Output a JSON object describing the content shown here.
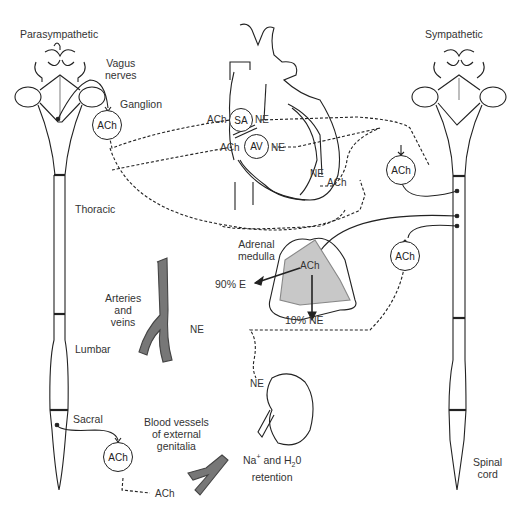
{
  "titles": {
    "left": "Parasympathetic",
    "right": "Sympathetic"
  },
  "labels": {
    "vagus_nerves_1": "Vagus",
    "vagus_nerves_2": "nerves",
    "ganglion": "Ganglion",
    "thoracic": "Thoracic",
    "lumbar": "Lumbar",
    "sacral": "Sacral",
    "arteries_1": "Arteries",
    "arteries_2": "and",
    "arteries_3": "veins",
    "adrenal_1": "Adrenal",
    "adrenal_2": "medulla",
    "epinephrine_pct": "90% E",
    "norepinephrine_pct": "10% NE",
    "genitalia_1": "Blood vessels",
    "genitalia_2": "of external",
    "genitalia_3": "genitalia",
    "kidney_na": "Na",
    "kidney_plus": "+",
    "kidney_and": " and H",
    "kidney_sub2": "2",
    "kidney_0": "0",
    "kidney_retention": "retention",
    "spinal_1": "Spinal",
    "spinal_2": "cord"
  },
  "nodes": {
    "para_ganglion": "ACh",
    "sa_node": "SA",
    "av_node": "AV",
    "symp_ganglion_upper": "ACh",
    "symp_ganglion_lower": "ACh",
    "adrenal_ach": "ACh",
    "sacral_ganglion": "ACh"
  },
  "transmitters": {
    "sa_ach": "ACh",
    "sa_ne": "NE",
    "av_ach": "ACh",
    "av_ne": "NE",
    "ventricle_ne": "NE",
    "ventricle_ach": "ACh",
    "vessel_ne": "NE",
    "kidney_ne": "NE",
    "genitalia_ach": "ACh"
  },
  "colors": {
    "line": "#222222",
    "vessel_fill": "#777777",
    "adrenal_fill": "#c8c8c8",
    "text": "#333333"
  }
}
